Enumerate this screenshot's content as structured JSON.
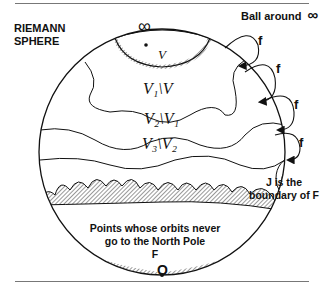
{
  "title": {
    "line1": "RIEMANN",
    "line2": "SPHERE"
  },
  "ball_label": "Ball around",
  "infinity_symbol": "∞",
  "origin_label": "O",
  "map_label": "f",
  "regions": [
    {
      "name": "V",
      "label": "V"
    },
    {
      "name": "V1-minus-V",
      "label": "V₁\\V"
    },
    {
      "name": "V2-minus-V1",
      "label": "V₂\\V₁"
    },
    {
      "name": "V3-minus-V2",
      "label": "V₃\\V₂"
    }
  ],
  "filled_set_text": {
    "line1": "Points whose orbits never",
    "line2": "go to the North Pole",
    "line3": "F"
  },
  "julia_text": {
    "line1": "J is the",
    "line2": "boundary of F"
  }
}
